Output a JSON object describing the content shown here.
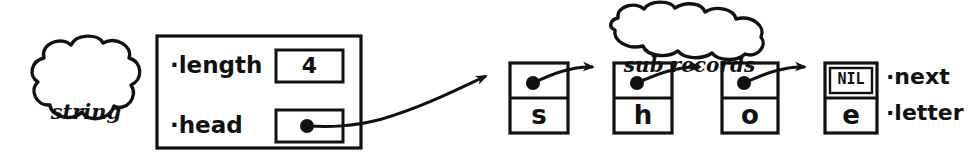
{
  "diagram": {
    "ink_color": "#111111",
    "background_color": "#ffffff",
    "clouds": [
      {
        "id": "string-record",
        "line1": "string",
        "line2": "record"
      },
      {
        "id": "sub-records",
        "line1": "sub records",
        "line2": ""
      }
    ],
    "record": {
      "fields": [
        {
          "label": "·length",
          "value": "4",
          "value_kind": "number"
        },
        {
          "label": "·head",
          "value": "",
          "value_kind": "pointer"
        }
      ]
    },
    "nodes": [
      {
        "id": "node-s",
        "next": "●",
        "next_kind": "pointer",
        "letter": "s"
      },
      {
        "id": "node-h",
        "next": "●",
        "next_kind": "pointer",
        "letter": "h"
      },
      {
        "id": "node-o",
        "next": "●",
        "next_kind": "pointer",
        "letter": "o"
      },
      {
        "id": "node-e",
        "next": "NIL",
        "next_kind": "nil",
        "letter": "e"
      }
    ],
    "field_labels": [
      {
        "id": "next-label",
        "text": "·next"
      },
      {
        "id": "letter-label",
        "text": "·letter"
      }
    ]
  }
}
